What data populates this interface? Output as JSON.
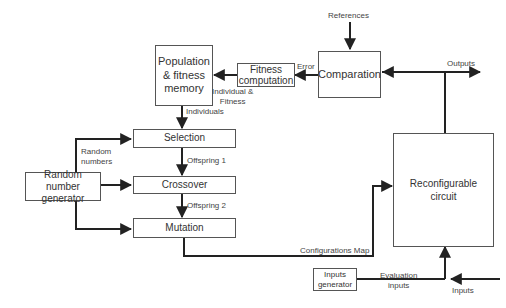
{
  "diagram": {
    "blocks": {
      "population_memory": "Population & fitness memory",
      "population_memory_lines": [
        "Population",
        "& fitness",
        "memory"
      ],
      "fitness_computation_lines": [
        "Fitness",
        "computation"
      ],
      "comparation": "Comparation",
      "selection": "Selection",
      "crossover": "Crossover",
      "mutation": "Mutation",
      "random_number_generator_lines": [
        "Random number",
        "generator"
      ],
      "reconfigurable_circuit_lines": [
        "Reconfigurable",
        "circuit"
      ],
      "inputs_generator_lines": [
        "Inputs",
        "generator"
      ]
    },
    "edge_labels": {
      "references": "References",
      "outputs": "Outputs",
      "error": "Error",
      "individual_fitness_lines": [
        "Individual &",
        "Fitness"
      ],
      "individuals": "Individuals",
      "random_numbers_lines": [
        "Random",
        "numbers"
      ],
      "offspring1": "Offspring 1",
      "offspring2": "Offspring 2",
      "configurations_map": "Configurations Map",
      "evaluation_inputs_lines": [
        "Evaluation",
        "inputs"
      ],
      "inputs": "Inputs"
    }
  }
}
